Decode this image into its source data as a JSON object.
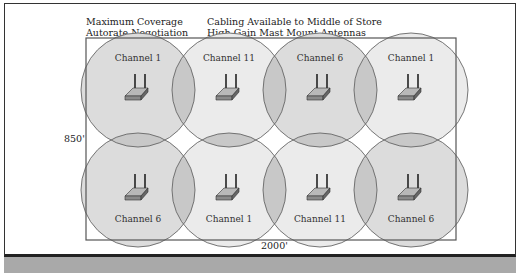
{
  "diagram": {
    "header_left": [
      "Maximum Coverage",
      "Autorate Negotiation"
    ],
    "header_right": [
      "Cabling Available to Middle of Store",
      "High-Gain Mast Mount Antennas"
    ],
    "height_label": "850'",
    "width_label": "2000'",
    "colors": {
      "cell_light": "#ebebeb",
      "cell_medium": "#dcdcdc",
      "overlap": "#c8c8c8",
      "outline": "#666666",
      "bottom_bar": "#a9a9a9"
    },
    "access_points": [
      {
        "row": 0,
        "col": 0,
        "channel": "Channel 1",
        "shade": "medium"
      },
      {
        "row": 0,
        "col": 1,
        "channel": "Channel 11",
        "shade": "light"
      },
      {
        "row": 0,
        "col": 2,
        "channel": "Channel 6",
        "shade": "medium"
      },
      {
        "row": 0,
        "col": 3,
        "channel": "Channel 1",
        "shade": "light"
      },
      {
        "row": 1,
        "col": 0,
        "channel": "Channel 6",
        "shade": "medium"
      },
      {
        "row": 1,
        "col": 1,
        "channel": "Channel 1",
        "shade": "light"
      },
      {
        "row": 1,
        "col": 2,
        "channel": "Channel 11",
        "shade": "light"
      },
      {
        "row": 1,
        "col": 3,
        "channel": "Channel 6",
        "shade": "medium"
      }
    ]
  }
}
